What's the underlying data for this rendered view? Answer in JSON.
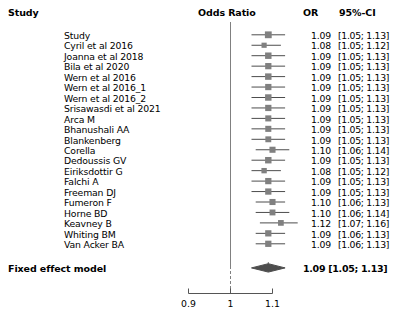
{
  "header": {
    "study_col": "Study",
    "plot_col": "Odds Ratio",
    "or_col": "OR",
    "ci_col": "95%-CI"
  },
  "summary": {
    "label": "Fixed effect model",
    "stat": "1.09 [1.05; 1.13]",
    "or": 1.09,
    "ci_low": 1.05,
    "ci_high": 1.13
  },
  "axis": {
    "ticks": [
      "0.9",
      "1",
      "1.1"
    ],
    "tick_values": [
      0.9,
      1.0,
      1.1
    ],
    "ref_line": 1.0
  },
  "colors": {
    "marker": "#808080",
    "line": "#4d4d4d",
    "diamond": "#4d4d4d",
    "ref_line": "#808080",
    "text": "#000000",
    "background": "#ffffff"
  },
  "chart_data": {
    "type": "forest",
    "title": "Odds Ratio",
    "xlabel": "",
    "ylabel": "",
    "xlim": [
      0.9,
      1.1
    ],
    "xscale": "log",
    "grid": false,
    "legend": "none",
    "effect_measure": "Odds Ratio",
    "model": "Fixed effect model",
    "categories": [
      "Study",
      "Cyril et al 2016",
      "Joanna et al 2018",
      "Bila et al 2020",
      "Wern et al 2016",
      "Wern et al 2016_1",
      "Wern et al 2016_2",
      "Srisawasdi et al 2021",
      "Arca M",
      "Bhanushali AA",
      "Blankenberg",
      "Corella",
      "Dedoussis GV",
      "Eiriksdottir G",
      "Falchi A",
      "Freeman DJ",
      "Fumeron F",
      "Horne BD",
      "Keavney B",
      "Whiting BM",
      "Van Acker BA"
    ],
    "values": [
      1.09,
      1.08,
      1.09,
      1.09,
      1.09,
      1.09,
      1.09,
      1.09,
      1.09,
      1.09,
      1.09,
      1.1,
      1.09,
      1.08,
      1.09,
      1.09,
      1.1,
      1.1,
      1.12,
      1.09,
      1.09
    ],
    "ci_low": [
      1.05,
      1.05,
      1.05,
      1.05,
      1.05,
      1.05,
      1.05,
      1.05,
      1.05,
      1.05,
      1.05,
      1.06,
      1.05,
      1.05,
      1.05,
      1.05,
      1.06,
      1.06,
      1.07,
      1.06,
      1.06
    ],
    "ci_high": [
      1.13,
      1.12,
      1.13,
      1.13,
      1.13,
      1.13,
      1.13,
      1.13,
      1.13,
      1.13,
      1.13,
      1.14,
      1.13,
      1.12,
      1.13,
      1.13,
      1.13,
      1.14,
      1.16,
      1.13,
      1.13
    ],
    "or_text": [
      "1.09",
      "1.08",
      "1.09",
      "1.09",
      "1.09",
      "1.09",
      "1.09",
      "1.09",
      "1.09",
      "1.09",
      "1.09",
      "1.10",
      "1.09",
      "1.08",
      "1.09",
      "1.09",
      "1.10",
      "1.10",
      "1.12",
      "1.09",
      "1.09"
    ],
    "ci_text": [
      "[1.05; 1.13]",
      "[1.05; 1.12]",
      "[1.05; 1.13]",
      "[1.05; 1.13]",
      "[1.05; 1.13]",
      "[1.05; 1.13]",
      "[1.05; 1.13]",
      "[1.05; 1.13]",
      "[1.05; 1.13]",
      "[1.05; 1.13]",
      "[1.05; 1.13]",
      "[1.06; 1.14]",
      "[1.05; 1.13]",
      "[1.05; 1.12]",
      "[1.05; 1.13]",
      "[1.05; 1.13]",
      "[1.06; 1.13]",
      "[1.06; 1.14]",
      "[1.07; 1.16]",
      "[1.06; 1.13]",
      "[1.06; 1.13]"
    ],
    "weights": [
      1.0,
      0.55,
      0.9,
      0.85,
      0.9,
      0.85,
      0.9,
      0.85,
      0.8,
      0.8,
      0.75,
      0.8,
      0.9,
      0.6,
      0.85,
      0.85,
      0.8,
      0.75,
      0.7,
      0.85,
      0.85
    ],
    "summary": {
      "label": "Fixed effect model",
      "value": 1.09,
      "ci_low": 1.05,
      "ci_high": 1.13
    }
  }
}
